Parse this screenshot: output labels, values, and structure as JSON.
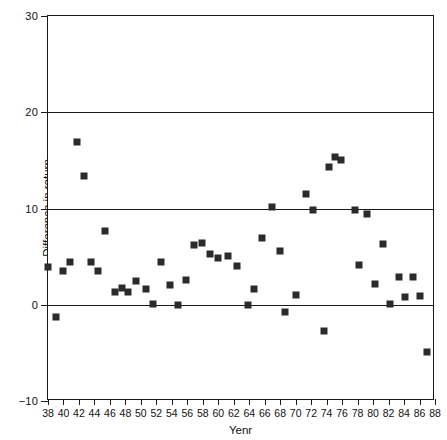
{
  "chart_data": {
    "type": "scatter",
    "title": "",
    "xlabel": "Yenr",
    "ylabel": "Difference in return",
    "xlim": [
      38,
      88
    ],
    "ylim": [
      -10,
      30
    ],
    "xticks": [
      38,
      40,
      42,
      44,
      46,
      48,
      50,
      52,
      54,
      56,
      58,
      60,
      62,
      64,
      66,
      68,
      70,
      72,
      74,
      76,
      78,
      80,
      82,
      84,
      86,
      88
    ],
    "yticks": [
      -10,
      0,
      10,
      20,
      30
    ],
    "gridlines_y": [
      0,
      10,
      20
    ],
    "grid": "horizontal-major-only",
    "legend": "none",
    "marker": "filled-square",
    "marker_color": "#2b2b2b",
    "points": [
      {
        "x": 38.0,
        "y": 3.9
      },
      {
        "x": 39.0,
        "y": -1.3
      },
      {
        "x": 39.9,
        "y": 3.5
      },
      {
        "x": 40.8,
        "y": 4.4
      },
      {
        "x": 41.7,
        "y": 16.9
      },
      {
        "x": 42.6,
        "y": 13.4
      },
      {
        "x": 43.5,
        "y": 4.4
      },
      {
        "x": 44.4,
        "y": 3.5
      },
      {
        "x": 45.4,
        "y": 7.7
      },
      {
        "x": 46.6,
        "y": 1.3
      },
      {
        "x": 47.5,
        "y": 1.7
      },
      {
        "x": 48.4,
        "y": 1.3
      },
      {
        "x": 49.4,
        "y": 2.5
      },
      {
        "x": 50.6,
        "y": 1.6
      },
      {
        "x": 51.6,
        "y": 0.1
      },
      {
        "x": 52.6,
        "y": 4.4
      },
      {
        "x": 53.7,
        "y": 2.1
      },
      {
        "x": 54.8,
        "y": 0.0
      },
      {
        "x": 55.8,
        "y": 2.6
      },
      {
        "x": 56.9,
        "y": 6.2
      },
      {
        "x": 57.9,
        "y": 6.4
      },
      {
        "x": 58.9,
        "y": 5.3
      },
      {
        "x": 59.9,
        "y": 4.9
      },
      {
        "x": 61.3,
        "y": 5.1
      },
      {
        "x": 62.4,
        "y": 4.0
      },
      {
        "x": 63.8,
        "y": 0.0
      },
      {
        "x": 64.6,
        "y": 1.6
      },
      {
        "x": 65.7,
        "y": 6.9
      },
      {
        "x": 67.0,
        "y": 10.2
      },
      {
        "x": 68.0,
        "y": 5.6
      },
      {
        "x": 68.6,
        "y": -0.8
      },
      {
        "x": 70.0,
        "y": 1.0
      },
      {
        "x": 71.3,
        "y": 11.5
      },
      {
        "x": 72.3,
        "y": 9.8
      },
      {
        "x": 73.6,
        "y": -2.7
      },
      {
        "x": 74.3,
        "y": 14.3
      },
      {
        "x": 75.1,
        "y": 15.4
      },
      {
        "x": 75.9,
        "y": 15.0
      },
      {
        "x": 77.6,
        "y": 9.8
      },
      {
        "x": 78.2,
        "y": 4.1
      },
      {
        "x": 79.2,
        "y": 9.4
      },
      {
        "x": 80.2,
        "y": 2.2
      },
      {
        "x": 81.3,
        "y": 6.3
      },
      {
        "x": 82.2,
        "y": 0.1
      },
      {
        "x": 83.3,
        "y": 2.9
      },
      {
        "x": 84.1,
        "y": 0.8
      },
      {
        "x": 85.2,
        "y": 2.9
      },
      {
        "x": 86.0,
        "y": 0.9
      },
      {
        "x": 87.0,
        "y": -4.9
      }
    ]
  }
}
